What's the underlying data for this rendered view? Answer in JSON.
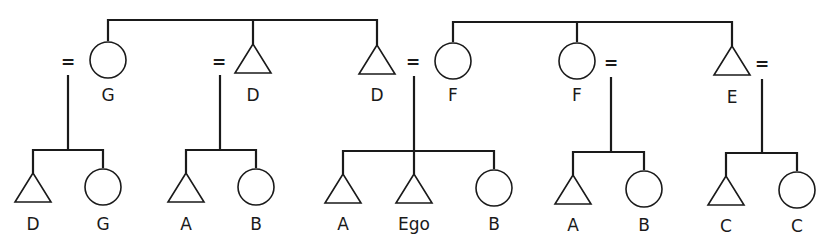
{
  "diagram": {
    "type": "kinship-chart",
    "colors": {
      "line": "#1a1a1a",
      "background": "#ffffff"
    },
    "marriage_symbol": "=",
    "generation_1": {
      "sibling_group_left": {
        "members": [
          {
            "id": "g1-1",
            "sex": "female",
            "symbol": "circle",
            "label": "G"
          },
          {
            "id": "g1-2",
            "sex": "male",
            "symbol": "triangle",
            "label": "D"
          },
          {
            "id": "g1-3",
            "sex": "male",
            "symbol": "triangle",
            "label": "D"
          }
        ]
      },
      "sibling_group_right": {
        "members": [
          {
            "id": "g1-4",
            "sex": "female",
            "symbol": "circle",
            "label": "F"
          },
          {
            "id": "g1-5",
            "sex": "female",
            "symbol": "circle",
            "label": "F"
          },
          {
            "id": "g1-6",
            "sex": "male",
            "symbol": "triangle",
            "label": "E"
          }
        ]
      },
      "marriages": [
        {
          "spouse_of": "g1-1",
          "side": "left"
        },
        {
          "spouse_of": "g1-2",
          "side": "left"
        },
        {
          "spouse_of": "g1-3",
          "side": "right"
        },
        {
          "spouse_of": "g1-5",
          "side": "right"
        },
        {
          "spouse_of": "g1-6",
          "side": "right"
        }
      ]
    },
    "generation_2": [
      {
        "parents": "g1-1 marriage",
        "children": [
          {
            "sex": "male",
            "symbol": "triangle",
            "label": "D"
          },
          {
            "sex": "female",
            "symbol": "circle",
            "label": "G"
          }
        ]
      },
      {
        "parents": "g1-2 marriage",
        "children": [
          {
            "sex": "male",
            "symbol": "triangle",
            "label": "A"
          },
          {
            "sex": "female",
            "symbol": "circle",
            "label": "B"
          }
        ]
      },
      {
        "parents": "g1-3 marriage",
        "children": [
          {
            "sex": "male",
            "symbol": "triangle",
            "label": "A"
          },
          {
            "sex": "male",
            "symbol": "triangle",
            "label": "Ego"
          },
          {
            "sex": "female",
            "symbol": "circle",
            "label": "B"
          }
        ]
      },
      {
        "parents": "g1-5 marriage",
        "children": [
          {
            "sex": "male",
            "symbol": "triangle",
            "label": "A"
          },
          {
            "sex": "female",
            "symbol": "circle",
            "label": "B"
          }
        ]
      },
      {
        "parents": "g1-6 marriage",
        "children": [
          {
            "sex": "male",
            "symbol": "triangle",
            "label": "C"
          },
          {
            "sex": "female",
            "symbol": "circle",
            "label": "C"
          }
        ]
      }
    ]
  }
}
